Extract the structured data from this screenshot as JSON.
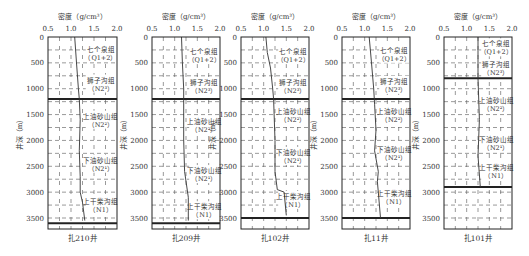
{
  "figure": {
    "x_axis_label": "密度（g/cm³）",
    "y_axis_label": "井深（m）",
    "x_ticks": [
      "0.5",
      "1.0",
      "1.5",
      "2.0"
    ],
    "y_ticks": [
      "0",
      "500",
      "1000",
      "1500",
      "2000",
      "2500",
      "3000",
      "3500"
    ]
  },
  "chart_data": [
    {
      "type": "line",
      "title": "扎210井",
      "xlabel": "密度（g/cm³）",
      "ylabel": "井深（m）",
      "xlim": [
        0.5,
        2.0
      ],
      "ylim": [
        0,
        3650
      ],
      "y_inverted": true,
      "grid": "dashed",
      "series": [
        {
          "name": "密度",
          "x": [
            1.08,
            1.12,
            1.16,
            1.18,
            1.2,
            1.18,
            1.2,
            1.2,
            1.25,
            1.3
          ],
          "y": [
            0,
            500,
            1000,
            1200,
            1600,
            2200,
            2700,
            3000,
            3200,
            3550
          ]
        }
      ],
      "formations": [
        {
          "name": "七个泉组",
          "code": "Q1+2",
          "top": 0,
          "bottom": 600
        },
        {
          "name": "狮子沟组",
          "code": "N2³",
          "top": 600,
          "bottom": 1200
        },
        {
          "name": "上油砂山组",
          "code": "N2²",
          "top": 1200,
          "bottom": 2000
        },
        {
          "name": "下油砂山组",
          "code": "N2¹",
          "top": 2000,
          "bottom": 2900
        },
        {
          "name": "上干柴沟组",
          "code": "N1",
          "top": 2900,
          "bottom": 3600
        }
      ],
      "thick_boundaries": [
        1200,
        3600
      ]
    },
    {
      "type": "line",
      "title": "扎209井",
      "xlabel": "密度（g/cm³）",
      "ylabel": "井深（m）",
      "xlim": [
        0.5,
        2.0
      ],
      "ylim": [
        0,
        3650
      ],
      "y_inverted": true,
      "grid": "dashed",
      "series": [
        {
          "name": "密度",
          "x": [
            1.15,
            1.17,
            1.2,
            1.2,
            1.2,
            1.22,
            1.3,
            1.3
          ],
          "y": [
            0,
            500,
            1000,
            1200,
            2000,
            2600,
            3100,
            3550
          ]
        }
      ],
      "formations": [
        {
          "name": "七个泉组",
          "code": "Q1+2",
          "top": 0,
          "bottom": 700
        },
        {
          "name": "狮子沟组",
          "code": "N2³",
          "top": 700,
          "bottom": 1200
        },
        {
          "name": "上油砂山组",
          "code": "N2²",
          "top": 1200,
          "bottom": 2200
        },
        {
          "name": "下油砂山组",
          "code": "N2¹",
          "top": 2200,
          "bottom": 3100
        },
        {
          "name": "上干柴沟组",
          "code": "N1",
          "top": 3100,
          "bottom": 3600
        }
      ],
      "thick_boundaries": [
        1200,
        3600
      ]
    },
    {
      "type": "line",
      "title": "扎102井",
      "xlabel": "密度（g/cm³）",
      "ylabel": "井深（m）",
      "xlim": [
        0.5,
        2.0
      ],
      "ylim": [
        0,
        3650
      ],
      "y_inverted": true,
      "grid": "dashed",
      "series": [
        {
          "name": "密度",
          "x": [
            1.05,
            1.08,
            1.15,
            1.2,
            1.22,
            1.25,
            1.25,
            1.3,
            1.45,
            1.5
          ],
          "y": [
            0,
            300,
            600,
            1000,
            1200,
            2000,
            2600,
            2950,
            3000,
            3450
          ]
        }
      ],
      "formations": [
        {
          "name": "七个泉组",
          "code": "Q1+2",
          "top": 0,
          "bottom": 700
        },
        {
          "name": "狮子沟组",
          "code": "N2³",
          "top": 700,
          "bottom": 1200
        },
        {
          "name": "上油砂山组",
          "code": "N2²",
          "top": 1200,
          "bottom": 1800
        },
        {
          "name": "下油砂山组",
          "code": "N2¹",
          "top": 1800,
          "bottom": 2800
        },
        {
          "name": "上干柴沟组",
          "code": "N1",
          "top": 2800,
          "bottom": 3500
        }
      ],
      "thick_boundaries": [
        1200,
        3500
      ]
    },
    {
      "type": "line",
      "title": "扎11井",
      "xlabel": "密度（g/cm³）",
      "ylabel": "井深（m）",
      "xlim": [
        0.5,
        2.0
      ],
      "ylim": [
        0,
        3650
      ],
      "y_inverted": true,
      "grid": "dashed",
      "series": [
        {
          "name": "密度",
          "x": [
            1.1,
            1.15,
            1.2,
            1.22,
            1.25,
            1.22,
            1.3,
            1.28,
            1.3,
            1.35
          ],
          "y": [
            0,
            500,
            1000,
            1300,
            1800,
            2200,
            2600,
            2800,
            3000,
            3500
          ]
        }
      ],
      "formations": [
        {
          "name": "七个泉组",
          "code": "Q1+2",
          "top": 0,
          "bottom": 650
        },
        {
          "name": "狮子沟组",
          "code": "N2³",
          "top": 650,
          "bottom": 1200
        },
        {
          "name": "上油砂山组",
          "code": "N2²",
          "top": 1200,
          "bottom": 1800
        },
        {
          "name": "下油砂山组",
          "code": "N2¹",
          "top": 1800,
          "bottom": 2700
        },
        {
          "name": "上干柴沟组",
          "code": "N1",
          "top": 2700,
          "bottom": 3500
        }
      ],
      "thick_boundaries": [
        1200,
        3500
      ]
    },
    {
      "type": "line",
      "title": "扎101井",
      "xlabel": "密度（g/cm³）",
      "ylabel": "井深（m）",
      "xlim": [
        0.5,
        2.0
      ],
      "ylim": [
        0,
        3650
      ],
      "y_inverted": true,
      "grid": "dashed",
      "series": [
        {
          "name": "密度",
          "x": [
            1.25,
            1.25,
            1.25,
            1.28,
            1.25,
            1.3
          ],
          "y": [
            0,
            400,
            800,
            1600,
            2300,
            2900
          ]
        }
      ],
      "formations": [
        {
          "name": "七个泉组",
          "code": "Q1+2",
          "top": 0,
          "bottom": 400
        },
        {
          "name": "狮子沟组",
          "code": "N2³",
          "top": 400,
          "bottom": 800
        },
        {
          "name": "上油砂山组",
          "code": "N2²",
          "top": 800,
          "bottom": 1800
        },
        {
          "name": "下油砂山组",
          "code": "N2¹",
          "top": 1800,
          "bottom": 2300
        },
        {
          "name": "上干柴沟组",
          "code": "N1",
          "top": 2300,
          "bottom": 2900
        }
      ],
      "thick_boundaries": [
        800,
        2900
      ]
    }
  ],
  "panels_layout": [
    {
      "left": 48,
      "right": 117
    },
    {
      "left": 152,
      "right": 220
    },
    {
      "left": 241,
      "right": 309
    },
    {
      "left": 342,
      "right": 410
    },
    {
      "left": 444,
      "right": 512
    }
  ],
  "colors": {
    "line": "#333333",
    "grid": "#555555",
    "frame": "#222222"
  }
}
